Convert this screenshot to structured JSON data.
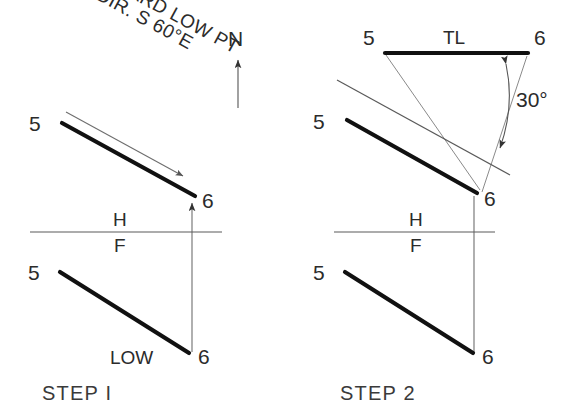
{
  "drawing": {
    "title_visible": false,
    "steps": [
      {
        "id": "step1",
        "caption": "STEP I",
        "notes": {
          "toward_low_point": "TOWARD LOW PT",
          "slope_direction": "SL. DIR. S 60°E",
          "low_marker": "LOW"
        },
        "compass": {
          "north_label": "N"
        },
        "fold_line": {
          "upper": "H",
          "lower": "F"
        },
        "top_view": {
          "point_a": "5",
          "point_b": "6"
        },
        "front_view": {
          "point_a": "5",
          "point_b": "6"
        }
      },
      {
        "id": "step2",
        "caption": "STEP 2",
        "notes": {
          "true_length": "TL",
          "slope_label": "SLOPE",
          "slope_angle": "30°"
        },
        "fold_line_inclined": {
          "upper": "I",
          "lower": "H"
        },
        "fold_line": {
          "upper": "H",
          "lower": "F"
        },
        "auxiliary_view": {
          "point_a": "5",
          "point_b": "6"
        },
        "top_view": {
          "point_a": "5",
          "point_b": "6"
        },
        "front_view": {
          "point_a": "5",
          "point_b": "6"
        }
      }
    ],
    "colors": {
      "object_line": "#111111",
      "construction_line": "#6e6e6e",
      "fold_line": "#5a5a5a",
      "text": "#2b2b2b",
      "background": "#ffffff"
    }
  }
}
